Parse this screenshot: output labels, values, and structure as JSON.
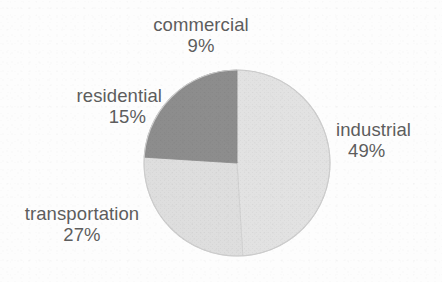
{
  "chart_data": {
    "type": "pie",
    "title": "",
    "subtitle": "",
    "xlabel": "",
    "ylabel": "",
    "legend_position": "none",
    "grid": false,
    "labels_inline": true,
    "categories": [
      "industrial",
      "transportation",
      "residential",
      "commercial"
    ],
    "values": [
      49,
      27,
      15,
      9
    ],
    "units": "%",
    "slices": [
      {
        "name": "industrial",
        "label": "industrial",
        "percent_text": "49%",
        "value": 49,
        "color": "#e2e2e2",
        "label_position": "right"
      },
      {
        "name": "transportation",
        "label": "transportation",
        "percent_text": "27%",
        "value": 27,
        "color": "#dedede",
        "label_position": "lower-left"
      },
      {
        "name": "residential",
        "label": "residential",
        "percent_text": "15%",
        "value": 15,
        "color": "#8d8d8d",
        "label_position": "upper-left"
      },
      {
        "name": "commercial",
        "label": "commercial",
        "percent_text": "9%",
        "value": 9,
        "color": "#8d8d8d",
        "label_position": "top"
      }
    ]
  },
  "figure": {
    "background_color": "#fdfdfd",
    "text_color": "#5d5d5d",
    "outline_color": "#c2c2c2",
    "center_x": 237,
    "center_y": 163,
    "radius": 93,
    "start_angle_deg": -90,
    "direction": "counterclockwise"
  }
}
